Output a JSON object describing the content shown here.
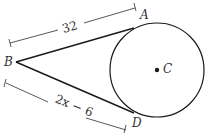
{
  "diagram": {
    "type": "geometry-tangent-segments",
    "colors": {
      "stroke": "#1a1a1a",
      "dimension": "#444444",
      "text": "#333333"
    },
    "points": {
      "A": {
        "label": "A"
      },
      "B": {
        "label": "B"
      },
      "C": {
        "label": "C"
      },
      "D": {
        "label": "D"
      }
    },
    "circle": {
      "center_label": "C"
    },
    "segments": [
      {
        "from": "B",
        "to": "A",
        "length_label": "32",
        "tangent": true
      },
      {
        "from": "B",
        "to": "D",
        "length_label": "2x − 6",
        "tangent": true
      }
    ]
  }
}
